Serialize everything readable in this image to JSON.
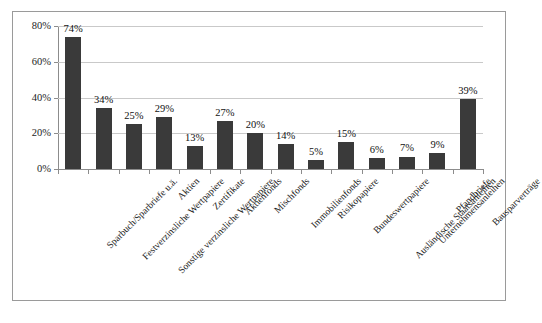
{
  "chart_data": {
    "type": "bar",
    "title": "",
    "subtitle": "",
    "xlabel": "",
    "ylabel": "",
    "ylim": [
      0,
      80
    ],
    "grid": true,
    "legend": false,
    "orientation": "vertical",
    "bar_color": "#3a3a3a",
    "value_suffix": "%",
    "categories": [
      "Sparbuch/Sparbriefe u.ä.",
      "Festverzinsliche Wertpapiere",
      "Sonstige verzinsliche Wertpapiere",
      "Aktien",
      "Zertifikate",
      "Aktienfonds",
      "Mischfonds",
      "Immobilienfonds",
      "Risikopapiere",
      "Bundeswertpapiere",
      "Ausländische Staatsanleihen",
      "Unternehmensanleihen",
      "Pfandbriefe",
      "Bausparverträge"
    ],
    "values": [
      74,
      34,
      25,
      29,
      13,
      27,
      20,
      14,
      5,
      15,
      6,
      7,
      9,
      39
    ],
    "data_labels": [
      "74%",
      "34%",
      "25%",
      "29%",
      "13%",
      "27%",
      "20%",
      "14%",
      "5%",
      "15%",
      "6%",
      "7%",
      "9%",
      "39%"
    ],
    "yticks": [
      0,
      20,
      40,
      60,
      80
    ],
    "ytick_labels": [
      "0%",
      "20%",
      "40%",
      "60%",
      "80%"
    ]
  }
}
